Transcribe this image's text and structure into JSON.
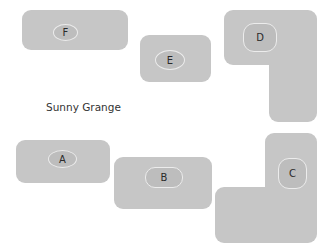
{
  "title": "Sunny Grange",
  "colors": {
    "block_fill": "#c6c6c6",
    "label_fill": "#bdbdbd",
    "label_stroke": "#ececec",
    "text": "#2a2a2a"
  },
  "blocks": [
    {
      "id": "A",
      "label": "A",
      "shape": "rectangle"
    },
    {
      "id": "B",
      "label": "B",
      "shape": "rectangle"
    },
    {
      "id": "C",
      "label": "C",
      "shape": "L-shape"
    },
    {
      "id": "D",
      "label": "D",
      "shape": "L-shape"
    },
    {
      "id": "E",
      "label": "E",
      "shape": "rectangle"
    },
    {
      "id": "F",
      "label": "F",
      "shape": "rectangle"
    }
  ]
}
